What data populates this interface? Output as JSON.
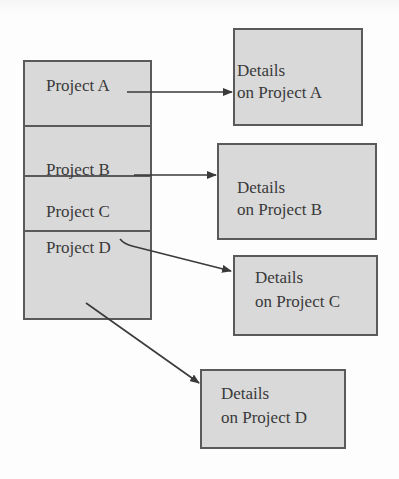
{
  "diagram": {
    "type": "project-to-details mapping",
    "colors": {
      "box_fill": "#d9d9d9",
      "border": "#5a5a5a",
      "text": "#3a3a3a",
      "arrow": "#3a3a3a",
      "background": "#fdfdfd"
    },
    "projects": [
      {
        "label": "Project A"
      },
      {
        "label": "Project B"
      },
      {
        "label": "Project C"
      },
      {
        "label": "Project D"
      }
    ],
    "details": [
      {
        "line1": "Details",
        "line2": "on Project A"
      },
      {
        "line1": "Details",
        "line2": "on Project B"
      },
      {
        "line1": "Details",
        "line2": "on Project C"
      },
      {
        "line1": "Details",
        "line2": "on Project D"
      }
    ],
    "arrows": [
      {
        "from": "Project A",
        "to": "Details on Project A"
      },
      {
        "from": "Project B",
        "to": "Details on Project B"
      },
      {
        "from": "Project C",
        "to": "Details on Project C"
      },
      {
        "from": "Project D",
        "to": "Details on Project D"
      }
    ]
  }
}
